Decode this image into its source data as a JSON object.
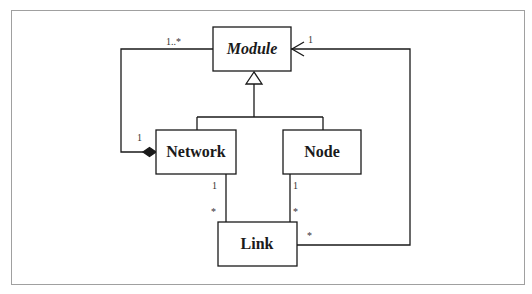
{
  "diagram": {
    "type": "UML class diagram",
    "classes": [
      {
        "id": "module",
        "label": "Module",
        "abstract": true
      },
      {
        "id": "network",
        "label": "Network",
        "abstract": false
      },
      {
        "id": "node",
        "label": "Node",
        "abstract": false
      },
      {
        "id": "link",
        "label": "Link",
        "abstract": false
      }
    ],
    "relations": [
      {
        "type": "generalization",
        "from": "network",
        "to": "module"
      },
      {
        "type": "generalization",
        "from": "node",
        "to": "module"
      },
      {
        "type": "composition",
        "whole": "network",
        "part": "module",
        "whole_mult": "1",
        "part_mult": "1..*"
      },
      {
        "type": "association",
        "from": "network",
        "to": "link",
        "from_mult": "1",
        "to_mult": "*"
      },
      {
        "type": "association",
        "from": "node",
        "to": "link",
        "from_mult": "1",
        "to_mult": "*"
      },
      {
        "type": "directed-association",
        "from": "link",
        "to": "module",
        "from_mult": "*",
        "to_mult": "1"
      }
    ],
    "multiplicities": {
      "module_network": "1..*",
      "network_composition": "1",
      "module_link": "1",
      "network_link_top": "1",
      "network_link_bottom": "*",
      "node_link_top": "1",
      "node_link_bottom": "*",
      "link_module": "*"
    },
    "colors": {
      "stroke": "#1a1a1a",
      "frame": "#a0a0a0",
      "background": "#ffffff"
    }
  }
}
